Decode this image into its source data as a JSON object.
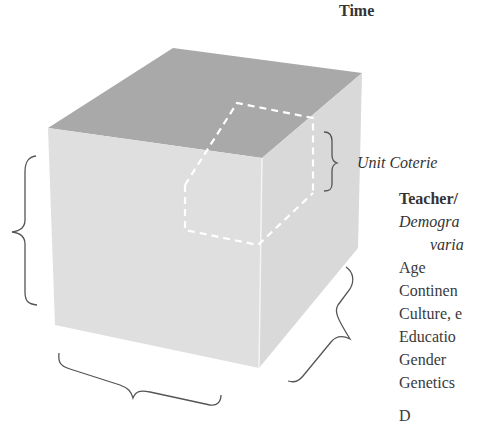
{
  "diagram": {
    "axis_top_label": "Time",
    "unit_label": "Unit Coterie",
    "panel": {
      "heading": "Teacher/",
      "subheading_line1": "Demogra",
      "subheading_line2": "varia",
      "items": [
        "Age",
        "Continen",
        "Culture, e",
        "Educatio",
        "Gender",
        "Genetics",
        "D"
      ]
    },
    "colors": {
      "top_face": "#a9a9a9",
      "front_face": "#dfdfdf",
      "right_face": "#d9d9d9",
      "dashed_outline": "#ffffff",
      "brace": "#555555",
      "text": "#333333"
    }
  }
}
